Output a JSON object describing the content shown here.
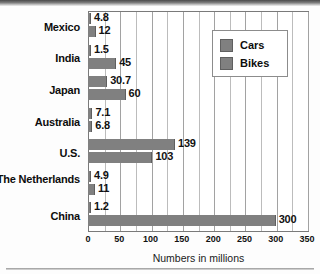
{
  "chart_data": {
    "type": "bar",
    "orientation": "horizontal",
    "title": "",
    "subtitle": "",
    "xlabel": "Numbers in millions",
    "ylabel": "",
    "xlim": [
      0,
      350
    ],
    "xticks": [
      0,
      50,
      100,
      150,
      200,
      250,
      300,
      350
    ],
    "xtick_labels": [
      "0",
      "50",
      "100",
      "150",
      "200",
      "250",
      "300",
      "350"
    ],
    "minor_gridline_step": 25,
    "grid": true,
    "legend_position": "upper right",
    "categories": [
      "Mexico",
      "India",
      "Japan",
      "Australia",
      "U.S.",
      "The Netherlands",
      "China"
    ],
    "series": [
      {
        "name": "Cars",
        "color": "#808080",
        "values": [
          4.8,
          1.5,
          30.7,
          7.1,
          139,
          4.9,
          1.2
        ],
        "value_labels": [
          "4.8",
          "1.5",
          "30.7",
          "7.1",
          "139",
          "4.9",
          "1.2"
        ]
      },
      {
        "name": "Bikes",
        "color": "#808080",
        "values": [
          12,
          45,
          60,
          6.8,
          103,
          11,
          300
        ],
        "value_labels": [
          "12",
          "45",
          "60",
          "6.8",
          "103",
          "11",
          "300"
        ]
      }
    ]
  },
  "legend": {
    "entries": [
      {
        "label": "Cars"
      },
      {
        "label": "Bikes"
      }
    ]
  },
  "colors": {
    "bar": "#808080",
    "bar_edge": "#5f5f5f",
    "gridline": "#bcbcbc",
    "frame": "#7a7a7a",
    "text": "#0d0d0d"
  }
}
